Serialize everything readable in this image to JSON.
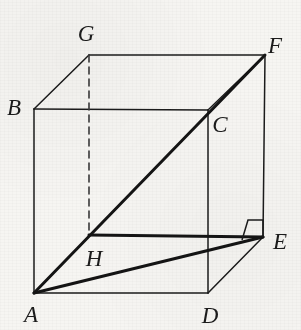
{
  "figure": {
    "canvas": {
      "width": 301,
      "height": 330
    },
    "colors": {
      "background": "#f6f5f2",
      "stroke": "#1b1b1b",
      "thick_stroke": "#141414",
      "hidden_stroke": "#3a3a3a",
      "label": "#1b1b1b"
    },
    "stroke_widths": {
      "thin": 1.5,
      "thick": 3.0,
      "hidden": 1.6
    },
    "hidden_dash": "7,5",
    "vertices": [
      {
        "id": "A",
        "label": "A",
        "x": 34,
        "y": 293,
        "label_x": 31,
        "label_y": 314
      },
      {
        "id": "B",
        "label": "B",
        "x": 34,
        "y": 109,
        "label_x": 14,
        "label_y": 107
      },
      {
        "id": "C",
        "label": "C",
        "x": 208,
        "y": 110,
        "label_x": 220,
        "label_y": 124
      },
      {
        "id": "D",
        "label": "D",
        "x": 208,
        "y": 293,
        "label_x": 210,
        "label_y": 315
      },
      {
        "id": "E",
        "label": "E",
        "x": 263,
        "y": 237,
        "label_x": 280,
        "label_y": 241
      },
      {
        "id": "F",
        "label": "F",
        "x": 265,
        "y": 55,
        "label_x": 275,
        "label_y": 45
      },
      {
        "id": "G",
        "label": "G",
        "x": 89,
        "y": 55,
        "label_x": 86,
        "label_y": 33
      },
      {
        "id": "H",
        "label": "H",
        "x": 89,
        "y": 235,
        "label_x": 94,
        "label_y": 258
      }
    ],
    "edges": [
      {
        "id": "AB",
        "from": "A",
        "to": "B",
        "style": "solid",
        "weight": "thin"
      },
      {
        "id": "AD",
        "from": "A",
        "to": "D",
        "style": "solid",
        "weight": "thin"
      },
      {
        "id": "BC",
        "from": "B",
        "to": "C",
        "style": "solid",
        "weight": "thin"
      },
      {
        "id": "BG",
        "from": "B",
        "to": "G",
        "style": "solid",
        "weight": "thin"
      },
      {
        "id": "CD",
        "from": "C",
        "to": "D",
        "style": "solid",
        "weight": "thin"
      },
      {
        "id": "CF",
        "from": "C",
        "to": "F",
        "style": "solid",
        "weight": "thin"
      },
      {
        "id": "DE",
        "from": "D",
        "to": "E",
        "style": "solid",
        "weight": "thin"
      },
      {
        "id": "EF",
        "from": "E",
        "to": "F",
        "style": "solid",
        "weight": "thin"
      },
      {
        "id": "GF",
        "from": "G",
        "to": "F",
        "style": "solid",
        "weight": "thin"
      },
      {
        "id": "HE",
        "from": "H",
        "to": "E",
        "style": "solid",
        "weight": "thick"
      },
      {
        "id": "GH",
        "from": "G",
        "to": "H",
        "style": "dashed",
        "weight": "hidden"
      },
      {
        "id": "AE",
        "from": "A",
        "to": "E",
        "style": "solid",
        "weight": "thick"
      },
      {
        "id": "AF",
        "from": "A",
        "to": "F",
        "style": "solid",
        "weight": "thick"
      }
    ],
    "right_angle_marker": {
      "id": "right-angle-at-E",
      "at": "E",
      "points": "242,240 248,220 263,220 263,237"
    }
  }
}
